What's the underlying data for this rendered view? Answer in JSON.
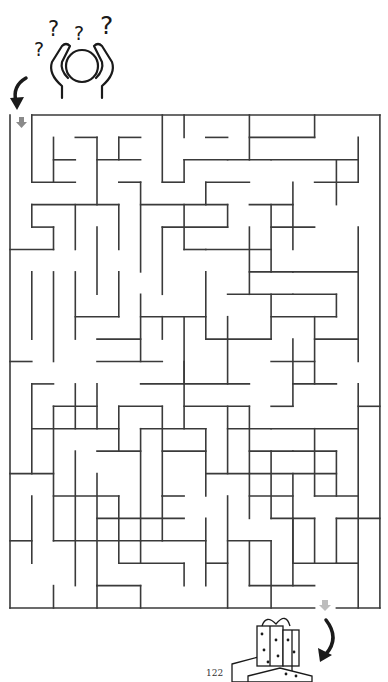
{
  "page": {
    "page_number": "122"
  },
  "colors": {
    "wall": "#3a3a3a",
    "arrow_black": "#1a1a1a",
    "arrow_gray": "#8a8a8a",
    "background": "#ffffff"
  },
  "maze": {
    "origin_x": 10,
    "origin_y": 115,
    "cell_w": 21.76,
    "cell_h": 22.41,
    "cols": 17,
    "rows": 22,
    "start": {
      "label": "start-arrow",
      "col": 0
    },
    "exit": {
      "label": "exit-arrow",
      "col": 14
    },
    "border": {
      "h": [
        [
          0,
          1,
          17
        ],
        [
          22,
          0,
          14
        ],
        [
          22,
          15,
          17
        ]
      ],
      "v": [
        [
          0,
          0,
          22
        ],
        [
          17,
          0,
          22
        ]
      ]
    },
    "walls_h": [
      [
        1,
        3,
        4
      ],
      [
        1,
        5,
        6
      ],
      [
        2,
        2,
        3
      ],
      [
        2,
        4,
        6
      ],
      [
        3,
        1,
        3
      ],
      [
        3,
        5,
        6
      ],
      [
        3,
        7,
        8
      ],
      [
        1,
        9,
        10
      ],
      [
        2,
        8,
        10
      ],
      [
        3,
        9,
        11
      ],
      [
        1,
        11,
        14
      ],
      [
        2,
        10,
        12
      ],
      [
        2,
        12,
        16
      ],
      [
        3,
        14,
        16
      ],
      [
        4,
        1,
        5
      ],
      [
        4,
        6,
        10
      ],
      [
        4,
        11,
        13
      ],
      [
        5,
        1,
        2
      ],
      [
        5,
        7,
        10
      ],
      [
        5,
        12,
        14
      ],
      [
        6,
        0,
        2
      ],
      [
        6,
        8,
        9
      ],
      [
        6,
        9,
        12
      ],
      [
        7,
        11,
        13
      ],
      [
        7,
        13,
        16
      ],
      [
        8,
        10,
        13
      ],
      [
        8,
        13,
        15
      ],
      [
        9,
        3,
        5
      ],
      [
        9,
        6,
        9
      ],
      [
        9,
        12,
        15
      ],
      [
        10,
        4,
        6
      ],
      [
        10,
        9,
        12
      ],
      [
        10,
        14,
        16
      ],
      [
        11,
        0,
        1
      ],
      [
        11,
        4,
        7
      ],
      [
        11,
        12,
        14
      ],
      [
        12,
        1,
        2
      ],
      [
        12,
        6,
        11
      ],
      [
        12,
        13,
        15
      ],
      [
        13,
        2,
        4
      ],
      [
        13,
        5,
        7
      ],
      [
        13,
        8,
        11
      ],
      [
        13,
        12,
        13
      ],
      [
        13,
        16,
        17
      ],
      [
        14,
        1,
        5
      ],
      [
        14,
        6,
        9
      ],
      [
        14,
        10,
        12
      ],
      [
        14,
        12,
        16
      ],
      [
        15,
        4,
        6
      ],
      [
        15,
        7,
        9
      ],
      [
        15,
        11,
        13
      ],
      [
        15,
        13,
        15
      ],
      [
        16,
        0,
        2
      ],
      [
        16,
        9,
        11
      ],
      [
        16,
        11,
        15
      ],
      [
        17,
        2,
        5
      ],
      [
        17,
        7,
        8
      ],
      [
        17,
        11,
        13
      ],
      [
        17,
        14,
        16
      ],
      [
        18,
        4,
        8
      ],
      [
        18,
        12,
        14
      ],
      [
        18,
        15,
        17
      ],
      [
        19,
        0,
        1
      ],
      [
        19,
        2,
        6
      ],
      [
        19,
        6,
        9
      ],
      [
        19,
        10,
        12
      ],
      [
        20,
        5,
        8
      ],
      [
        20,
        9,
        10
      ],
      [
        20,
        13,
        15
      ],
      [
        21,
        4,
        6
      ],
      [
        21,
        11,
        14
      ],
      [
        20,
        15,
        16
      ]
    ],
    "walls_v": [
      [
        1,
        0,
        3
      ],
      [
        2,
        1,
        3
      ],
      [
        4,
        1,
        4
      ],
      [
        5,
        1,
        2
      ],
      [
        6,
        3,
        7
      ],
      [
        7,
        0,
        3
      ],
      [
        8,
        0,
        1
      ],
      [
        8,
        2,
        3
      ],
      [
        11,
        0,
        2
      ],
      [
        14,
        0,
        1
      ],
      [
        15,
        2,
        4
      ],
      [
        16,
        1,
        3
      ],
      [
        16,
        5,
        11
      ],
      [
        13,
        3,
        6
      ],
      [
        12,
        4,
        7
      ],
      [
        11,
        5,
        8
      ],
      [
        10,
        4,
        5
      ],
      [
        1,
        4,
        5
      ],
      [
        2,
        5,
        6
      ],
      [
        3,
        4,
        6
      ],
      [
        4,
        5,
        8
      ],
      [
        5,
        4,
        6
      ],
      [
        7,
        5,
        8
      ],
      [
        8,
        4,
        6
      ],
      [
        9,
        3,
        4
      ],
      [
        3,
        7,
        10
      ],
      [
        2,
        7,
        11
      ],
      [
        1,
        7,
        10
      ],
      [
        5,
        7,
        9
      ],
      [
        6,
        8,
        11
      ],
      [
        7,
        9,
        10
      ],
      [
        8,
        9,
        12
      ],
      [
        9,
        7,
        10
      ],
      [
        10,
        9,
        12
      ],
      [
        12,
        8,
        10
      ],
      [
        13,
        10,
        13
      ],
      [
        14,
        9,
        12
      ],
      [
        15,
        8,
        9
      ],
      [
        16,
        12,
        22
      ],
      [
        1,
        12,
        16
      ],
      [
        2,
        13,
        19
      ],
      [
        3,
        12,
        14
      ],
      [
        4,
        12,
        14
      ],
      [
        5,
        13,
        15
      ],
      [
        6,
        14,
        20
      ],
      [
        7,
        13,
        17
      ],
      [
        8,
        11,
        14
      ],
      [
        9,
        14,
        17
      ],
      [
        10,
        13,
        16
      ],
      [
        11,
        13,
        18
      ],
      [
        12,
        15,
        18
      ],
      [
        13,
        16,
        20
      ],
      [
        14,
        14,
        17
      ],
      [
        15,
        15,
        17
      ],
      [
        3,
        15,
        21
      ],
      [
        4,
        16,
        21
      ],
      [
        5,
        17,
        20
      ],
      [
        7,
        17,
        19
      ],
      [
        8,
        20,
        21
      ],
      [
        9,
        18,
        21
      ],
      [
        10,
        17,
        22
      ],
      [
        11,
        19,
        21
      ],
      [
        12,
        19,
        22
      ],
      [
        13,
        18,
        21
      ],
      [
        14,
        18,
        20
      ],
      [
        15,
        18,
        20
      ],
      [
        1,
        17,
        20
      ],
      [
        2,
        21,
        22
      ],
      [
        4,
        21,
        22
      ],
      [
        6,
        21,
        22
      ]
    ]
  },
  "illustrations": {
    "top": {
      "name": "confused-person-with-question-marks",
      "question_marks": [
        "?",
        "?",
        "?",
        "?"
      ]
    },
    "bottom": {
      "name": "stack-of-gift-boxes"
    }
  }
}
